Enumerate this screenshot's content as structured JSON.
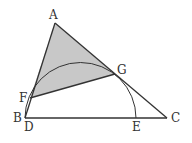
{
  "diagram": {
    "type": "geometry",
    "colors": {
      "stroke": "#333333",
      "shade": "#c8c8c8",
      "background": "#ffffff"
    },
    "points": {
      "A": {
        "label": "A",
        "x": 55,
        "y": 23
      },
      "F": {
        "label": "F",
        "x": 30,
        "y": 98
      },
      "G": {
        "label": "G",
        "x": 115,
        "y": 74
      },
      "B": {
        "label": "B",
        "x": 25,
        "y": 118
      },
      "D": {
        "label": "D",
        "x": 25,
        "y": 118
      },
      "E": {
        "label": "E",
        "x": 136,
        "y": 118
      },
      "C": {
        "label": "C",
        "x": 167,
        "y": 118
      }
    },
    "shaded_region": [
      "A",
      "F",
      "G"
    ],
    "arc": {
      "from": "D",
      "to": "E",
      "center_x": 80.5,
      "center_y": 118,
      "radius": 55.5
    }
  }
}
